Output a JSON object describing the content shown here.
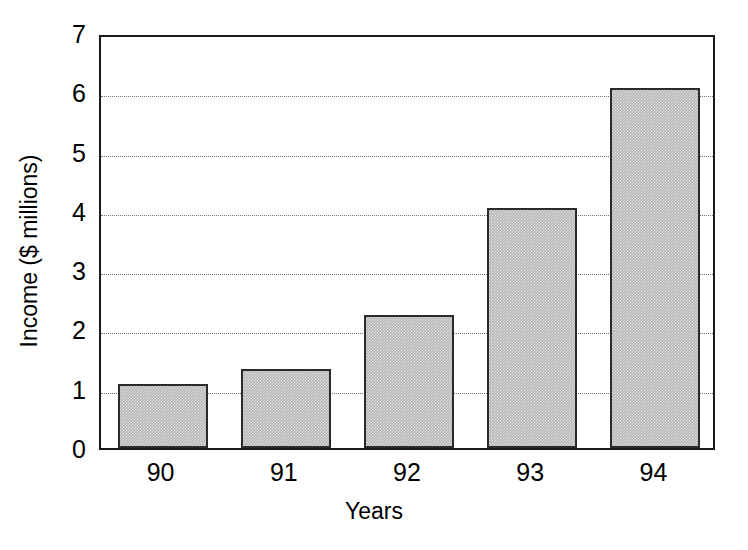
{
  "chart_data": {
    "type": "bar",
    "title": "",
    "subtitle": "",
    "xlabel": "Years",
    "ylabel": "Income ($ millions)",
    "categories": [
      "90",
      "91",
      "92",
      "93",
      "94"
    ],
    "values": [
      1.08,
      1.33,
      2.24,
      4.05,
      6.07
    ],
    "series": [
      {
        "name": "Income",
        "values": [
          1.08,
          1.33,
          2.24,
          4.05,
          6.07
        ]
      }
    ],
    "ylim": [
      0,
      7
    ],
    "yticks": [
      0,
      1,
      2,
      3,
      4,
      5,
      6,
      7
    ],
    "ytick_labels": [
      "0",
      "1",
      "2",
      "3",
      "4",
      "5",
      "6",
      "7"
    ],
    "xtick_labels": [
      "90",
      "91",
      "92",
      "93",
      "94"
    ],
    "grid": "horizontal-dotted",
    "grid_values": [
      1,
      2,
      3,
      4,
      5,
      6
    ],
    "legend": "none",
    "bar_fill_color": "#b4b4b4",
    "bar_edge_color": "#2a2a2a",
    "axis_color": "#1a1a1a",
    "grid_color": "#6e6e6e",
    "background_color": "#ffffff"
  }
}
